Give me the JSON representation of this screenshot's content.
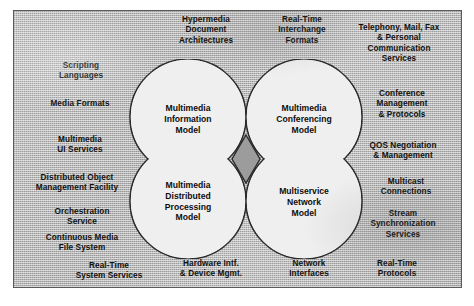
{
  "diagram": {
    "shape": "quatrefoil",
    "colors": {
      "background": "#b9b9b9",
      "petal_fill": "#eeeeee",
      "petal_stroke": "#2b2b2b",
      "diamond_fill": "#9c9c9c",
      "diamond_stroke": "#2b2b2b",
      "text": "#111111",
      "frame_border": "#5a5a5a"
    },
    "core_models": [
      {
        "id": "information-model",
        "label": "Multimedia\nInformation\nModel"
      },
      {
        "id": "conferencing-model",
        "label": "Multimedia\nConferencing\nModel"
      },
      {
        "id": "distributed-processing-model",
        "label": "Multimedia\nDistributed\nProcessing\nModel"
      },
      {
        "id": "multiservice-network-model",
        "label": "Multiservice\nNetwork\nModel"
      }
    ],
    "center_node": {
      "id": "center-diamond",
      "label": ""
    },
    "outer_labels": {
      "top": [
        {
          "id": "hypermedia-document-architectures",
          "label": "Hypermedia\nDocument\nArchitectures"
        },
        {
          "id": "real-time-interchange-formats",
          "label": "Real-Time\nInterchange\nFormats"
        },
        {
          "id": "telephony-mail-fax-personal-communication-services",
          "label": "Telephony, Mail, Fax\n& Personal\nCommunication\nServices"
        }
      ],
      "left": [
        {
          "id": "scripting-languages",
          "label": "Scripting\nLanguages"
        },
        {
          "id": "media-formats",
          "label": "Media Formats"
        },
        {
          "id": "multimedia-ui-services",
          "label": "Multimedia\nUI Services"
        },
        {
          "id": "distributed-object-management-facility",
          "label": "Distributed Object\nManagement Facility"
        },
        {
          "id": "orchestration-service",
          "label": "Orchestration\nService"
        },
        {
          "id": "continuous-media-file-system",
          "label": "Continuous Media\nFile System"
        },
        {
          "id": "real-time-system-services",
          "label": "Real-Time\nSystem Services"
        }
      ],
      "right": [
        {
          "id": "conference-management-protocols",
          "label": "Conference\nManagement\n& Protocols"
        },
        {
          "id": "qos-negotiation-management",
          "label": "QOS Negotiation\n& Management"
        },
        {
          "id": "multicast-connections",
          "label": "Multicast\nConnections"
        },
        {
          "id": "stream-synchronization-services",
          "label": "Stream\nSynchronization\nServices"
        },
        {
          "id": "real-time-protocols",
          "label": "Real-Time\nProtocols"
        }
      ],
      "bottom": [
        {
          "id": "hardware-intf-device-mgmt",
          "label": "Hardware Intf.\n& Device Mgmt."
        },
        {
          "id": "network-interfaces",
          "label": "Network\nInterfaces"
        }
      ]
    }
  }
}
